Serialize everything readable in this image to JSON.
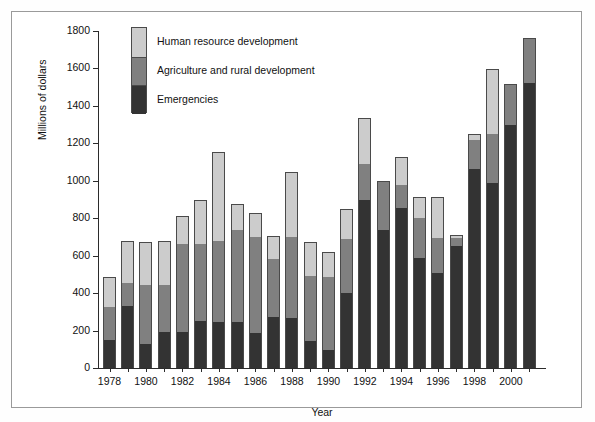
{
  "figure": {
    "background": "#ffffff",
    "border_color": "#9a9a9a"
  },
  "chart_data": {
    "type": "bar",
    "subtype": "stacked",
    "title": "",
    "xlabel": "Year",
    "ylabel": "Millions of dollars",
    "ylim": [
      0,
      1800
    ],
    "ytick_labels": [
      "0",
      "200",
      "400",
      "600",
      "800",
      "1000",
      "1200",
      "1400",
      "1600",
      "1800"
    ],
    "yticks": [
      0,
      200,
      400,
      600,
      800,
      1000,
      1200,
      1400,
      1600,
      1800
    ],
    "xtick_labels": [
      "1978",
      "1980",
      "1982",
      "1984",
      "1986",
      "1988",
      "1990",
      "1992",
      "1994",
      "1996",
      "1998",
      "2000"
    ],
    "grid": false,
    "legend_position": "upper-left-inside",
    "categories": [
      "1978",
      "1979",
      "1980",
      "1981",
      "1982",
      "1983",
      "1984",
      "1985",
      "1986",
      "1987",
      "1988",
      "1989",
      "1990",
      "1991",
      "1992",
      "1993",
      "1994",
      "1995",
      "1996",
      "1997",
      "1998",
      "1999",
      "2000",
      "2001"
    ],
    "series": [
      {
        "name": "Emergencies",
        "color": "#333333",
        "values": [
          150,
          330,
          130,
          195,
          190,
          250,
          245,
          245,
          185,
          270,
          265,
          145,
          95,
          400,
          900,
          735,
          855,
          585,
          510,
          650,
          1065,
          990,
          1300,
          1520
        ]
      },
      {
        "name": "Agriculture and rural development",
        "color": "#808080",
        "values": [
          175,
          125,
          315,
          250,
          475,
          410,
          435,
          490,
          515,
          310,
          435,
          345,
          390,
          290,
          190,
          260,
          120,
          215,
          185,
          45,
          155,
          260,
          210,
          235
        ]
      },
      {
        "name": "Human resource development",
        "color": "#cccccc",
        "values": [
          155,
          220,
          225,
          230,
          140,
          230,
          470,
          135,
          125,
          120,
          340,
          180,
          130,
          155,
          240,
          0,
          145,
          110,
          215,
          10,
          25,
          340,
          0,
          0
        ]
      }
    ],
    "totals": [
      480,
      675,
      670,
      675,
      805,
      890,
      1150,
      870,
      825,
      700,
      1040,
      670,
      615,
      845,
      1330,
      995,
      1120,
      910,
      910,
      705,
      1245,
      1590,
      1510,
      1755
    ]
  },
  "legend": {
    "entries": [
      {
        "label": "Human resource development",
        "color": "#cccccc"
      },
      {
        "label": "Agriculture and rural development",
        "color": "#808080"
      },
      {
        "label": "Emergencies",
        "color": "#333333"
      }
    ]
  }
}
